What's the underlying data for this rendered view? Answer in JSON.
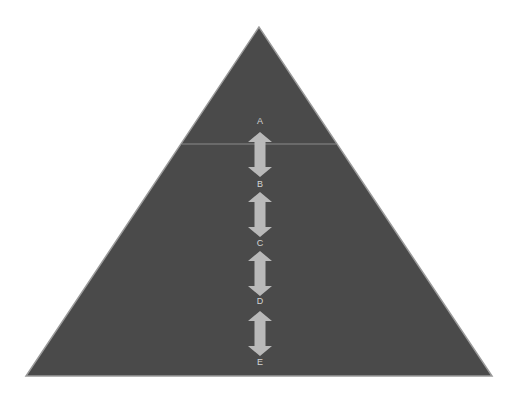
{
  "diagram": {
    "type": "pyramid",
    "canvas": {
      "width": 517,
      "height": 397,
      "background": "#ffffff"
    },
    "triangle": {
      "apex": [
        259,
        27
      ],
      "bottom_left": [
        26,
        376
      ],
      "bottom_right": [
        492,
        376
      ],
      "fill": "#4a4a4a",
      "edge": "#9a9a9a"
    },
    "divider": {
      "y": 144,
      "color": "#8a8a8a"
    },
    "arrow_style": {
      "fill": "#b9b9b9",
      "head_width": 24,
      "head_height": 10,
      "shaft_width": 11
    },
    "labels": [
      {
        "text": "A",
        "x": 260,
        "y": 116
      },
      {
        "text": "B",
        "x": 260,
        "y": 179
      },
      {
        "text": "C",
        "x": 260,
        "y": 238
      },
      {
        "text": "D",
        "x": 260,
        "y": 296
      },
      {
        "text": "E",
        "x": 260,
        "y": 357
      }
    ],
    "arrows": [
      {
        "from": "A",
        "to": "B",
        "x": 260,
        "y_top": 132,
        "y_bottom": 177
      },
      {
        "from": "B",
        "to": "C",
        "x": 260,
        "y_top": 192,
        "y_bottom": 237
      },
      {
        "from": "C",
        "to": "D",
        "x": 260,
        "y_top": 251,
        "y_bottom": 296
      },
      {
        "from": "D",
        "to": "E",
        "x": 260,
        "y_top": 311,
        "y_bottom": 356
      }
    ]
  }
}
